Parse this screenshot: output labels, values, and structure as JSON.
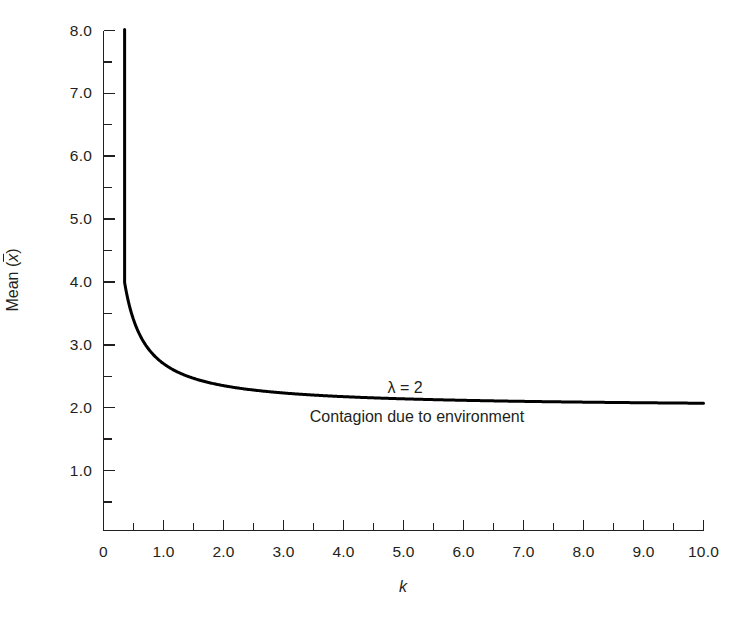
{
  "chart_data": {
    "type": "line",
    "title": "",
    "subtitle": "",
    "xlabel": "k",
    "ylabel": "Mean (x̄)",
    "ylabel_prefix": "Mean (",
    "ylabel_var": "x",
    "ylabel_suffix": ")",
    "xlim": [
      0,
      10
    ],
    "ylim": [
      0,
      8
    ],
    "grid": false,
    "legend": "none",
    "x_ticks_major": [
      0,
      1,
      2,
      3,
      4,
      5,
      6,
      7,
      8,
      9,
      10
    ],
    "x_tick_labels": [
      "0",
      "1.0",
      "2.0",
      "3.0",
      "4.0",
      "5.0",
      "6.0",
      "7.0",
      "8.0",
      "9.0",
      "10.0"
    ],
    "x_ticks_minor": [
      0.5,
      1.5,
      2.5,
      3.5,
      4.5,
      5.5,
      6.5,
      7.5,
      8.5,
      9.5
    ],
    "y_ticks_major": [
      1,
      2,
      3,
      4,
      5,
      6,
      7,
      8
    ],
    "y_tick_labels": [
      "1.0",
      "2.0",
      "3.0",
      "4.0",
      "5.0",
      "6.0",
      "7.0",
      "8.0"
    ],
    "y_ticks_minor": [
      0.5,
      1.5,
      2.5,
      3.5,
      4.5,
      5.5,
      6.5,
      7.5
    ],
    "annotations": [
      {
        "name": "lambda-value",
        "text": "λ = 2",
        "x": 5.03,
        "y": 2.42
      },
      {
        "name": "contagion-caption",
        "text": "Contagion due to environment",
        "x": 5.23,
        "y": 2.0
      }
    ],
    "series": [
      {
        "name": "mean",
        "formula": "mean = 2 + 0.7 / k",
        "line_color": "#000000",
        "line_width": 3.2,
        "x": [
          0.335,
          0.35,
          0.37,
          0.39,
          0.41,
          0.44,
          0.47,
          0.5,
          0.55,
          0.6,
          0.65,
          0.7,
          0.75,
          0.8,
          0.85,
          0.9,
          0.95,
          1.0,
          1.1,
          1.2,
          1.3,
          1.4,
          1.5,
          1.6,
          1.8,
          2.0,
          2.25,
          2.5,
          2.75,
          3.0,
          3.5,
          4.0,
          4.5,
          5.0,
          5.5,
          6.0,
          6.5,
          7.0,
          7.5,
          8.0,
          8.5,
          9.0,
          9.5,
          10.0
        ],
        "y": [
          8.09,
          8.0,
          7.89,
          7.79,
          7.71,
          7.59,
          7.49,
          7.4,
          7.27,
          7.17,
          7.08,
          7.0,
          6.93,
          6.88,
          6.82,
          6.78,
          6.74,
          6.7,
          6.64,
          6.58,
          6.54,
          6.5,
          6.47,
          6.44,
          6.39,
          6.35,
          6.31,
          6.28,
          6.25,
          6.23,
          6.2,
          6.18,
          6.16,
          6.14,
          6.13,
          6.12,
          6.11,
          6.1,
          6.09,
          6.09,
          6.08,
          6.08,
          6.07,
          6.07
        ]
      }
    ],
    "curve_values_note": "y values tabulated below as actual Mean readings",
    "series_actual": [
      {
        "name": "mean-actual",
        "x": [
          0.335,
          0.35,
          0.37,
          0.39,
          0.41,
          0.44,
          0.47,
          0.5,
          0.55,
          0.6,
          0.65,
          0.7,
          0.75,
          0.8,
          0.85,
          0.9,
          0.95,
          1.0,
          1.1,
          1.2,
          1.3,
          1.4,
          1.5,
          1.6,
          1.8,
          2.0,
          2.25,
          2.5,
          2.75,
          3.0,
          3.5,
          4.0,
          4.5,
          5.0,
          5.5,
          6.0,
          6.5,
          7.0,
          7.5,
          8.0,
          8.5,
          9.0,
          9.5,
          10.0
        ],
        "y": [
          8.09,
          8.0,
          7.89,
          7.79,
          7.71,
          7.59,
          7.49,
          7.4,
          7.27,
          7.17,
          7.08,
          7.0,
          6.93,
          6.88,
          6.82,
          6.78,
          6.74,
          6.7,
          6.64,
          6.58,
          6.54,
          6.5,
          6.47,
          6.44,
          6.39,
          6.35,
          6.31,
          6.28,
          6.25,
          6.23,
          6.2,
          6.18,
          6.16,
          6.14,
          6.13,
          6.12,
          6.11,
          6.1,
          6.09,
          6.09,
          6.08,
          6.08,
          6.07,
          6.07
        ]
      }
    ],
    "axis_color": "#231f20",
    "background_color": "#ffffff"
  }
}
